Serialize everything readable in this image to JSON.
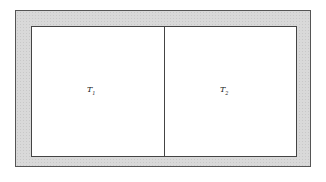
{
  "diagram": {
    "regions": [
      {
        "name": "T",
        "subscript": "1"
      },
      {
        "name": "T",
        "subscript": "2"
      }
    ],
    "colors": {
      "frame": "#d9d9d9",
      "interior": "#ffffff",
      "lines": "#444444"
    }
  }
}
